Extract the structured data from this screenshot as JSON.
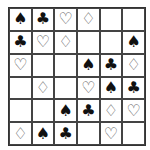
{
  "puzzle": {
    "title": "",
    "rows": 6,
    "cols": 6,
    "symbols": {
      "spade": "♠",
      "club": "♣",
      "heart": "♡",
      "diamond": "♢",
      "empty": ""
    },
    "grid": [
      [
        "spade",
        "club",
        "heart",
        "diamond",
        "empty",
        "empty"
      ],
      [
        "club",
        "heart",
        "diamond",
        "empty",
        "empty",
        "spade"
      ],
      [
        "heart",
        "empty",
        "empty",
        "spade",
        "club",
        "diamond"
      ],
      [
        "empty",
        "diamond",
        "empty",
        "heart",
        "spade",
        "club"
      ],
      [
        "empty",
        "empty",
        "spade",
        "club",
        "diamond",
        "heart"
      ],
      [
        "diamond",
        "spade",
        "club",
        "empty",
        "heart",
        "empty"
      ]
    ]
  }
}
